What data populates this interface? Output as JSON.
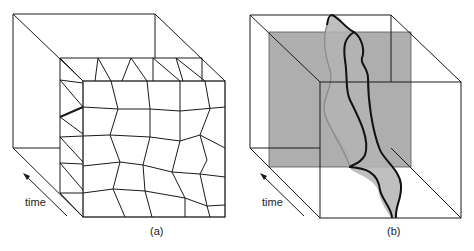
{
  "panels": [
    {
      "id": "a",
      "caption": "(a)",
      "time_label": "time",
      "description": "Space-time cube with a tessellated mesh slab (polygonal cells extruded over time)"
    },
    {
      "id": "b",
      "caption": "(b)",
      "time_label": "time",
      "description": "Space-time cube with a shaded time slice and an irregular tube-shaped region crossing it"
    }
  ],
  "colors": {
    "line": "#1a1a1a",
    "slice_fill": "#9a9a9a",
    "tube_fill": "#b4b4b4",
    "tube_hidden_edge": "#8a8a8a",
    "background": "#ffffff"
  }
}
